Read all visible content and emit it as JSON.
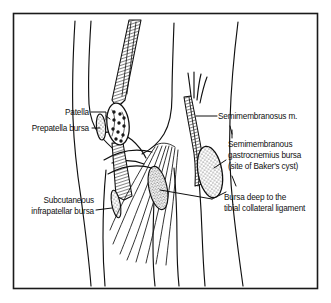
{
  "figure": {
    "border_color": "#1a1a1a",
    "ink_color": "#101010",
    "background_color": "#ffffff",
    "bursa_fill_color": "#b9b9b9",
    "patella_fill_color": "#ffffff"
  },
  "labels": {
    "patella": "Patella",
    "prepatella_bursa": "Prepatella bursa",
    "subcutaneous_infrapatellar_bursa_line1": "Subcutaneous",
    "subcutaneous_infrapatellar_bursa_line2": "infrapatellar bursa",
    "semimembranosus_muscle": "Semimembranosus m.",
    "baker_cyst_line1": "Semimembranous",
    "baker_cyst_line2": "gastrocnemius  bursa",
    "baker_cyst_line3": "(site of Baker's cyst)",
    "tibial_collateral_line1": "Bursa deep to the",
    "tibial_collateral_line2": "tibial collateral ligament"
  },
  "structures": {
    "quadriceps_tendon": "quadriceps-tendon",
    "patella": "patella-bone",
    "prepatella_bursa": "prepatella-bursa",
    "infrapatellar_bursa": "subcutaneous-infrapatellar-bursa",
    "semimembranosus": "semimembranosus-muscle",
    "baker_cyst": "semimembranous-gastrocnemius-bursa",
    "collateral_bursa": "tibial-collateral-ligament-bursa",
    "femur_outline": "femur-outline",
    "tibia_outline": "tibia-outline",
    "fibula_outline": "fibula-outline"
  }
}
